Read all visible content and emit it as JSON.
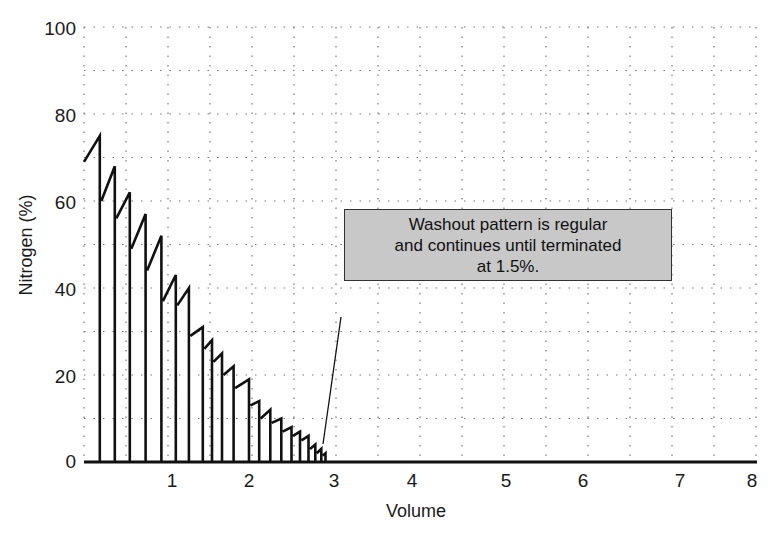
{
  "chart_data": {
    "type": "line",
    "title": "",
    "xlabel": "Volume",
    "ylabel": "Nitrogen (%)",
    "xlim": [
      0,
      8
    ],
    "ylim": [
      0,
      100
    ],
    "x_ticks": [
      "1",
      "2",
      "3",
      "4",
      "5",
      "6",
      "7",
      "8"
    ],
    "y_ticks": [
      "0",
      "20",
      "40",
      "60",
      "80",
      "100"
    ],
    "grid": true,
    "grid_style": "dotted",
    "legend": null,
    "series": [
      {
        "name": "Nitrogen washout (breath peaks)",
        "x": [
          0.18,
          0.35,
          0.52,
          0.7,
          0.88,
          1.05,
          1.22,
          1.4,
          1.52,
          1.65,
          1.8,
          2.0,
          2.12,
          2.25,
          2.38,
          2.5,
          2.6,
          2.7,
          2.78,
          2.85,
          2.9
        ],
        "start_values": [
          69,
          60,
          56,
          49,
          44,
          37,
          36,
          29,
          26,
          23,
          20,
          17,
          13,
          10,
          9,
          7,
          6,
          5,
          3,
          2,
          1.5
        ],
        "peak_values": [
          75,
          68,
          62,
          57,
          52,
          43,
          40,
          31,
          28,
          25,
          22,
          19,
          14,
          12,
          10,
          8,
          7,
          6,
          4,
          3,
          2
        ]
      }
    ],
    "annotations": [
      {
        "text": "Washout pattern is regular and continues until terminated at 1.5%.",
        "lines": [
          "Washout pattern is regular",
          "and continues until terminated",
          "at 1.5%."
        ],
        "pointer_to": {
          "x": 2.85,
          "y": 1.5
        }
      }
    ]
  },
  "annotation": {
    "line1": "Washout pattern is regular",
    "line2": "and continues until terminated",
    "line3": "at 1.5%."
  },
  "axes": {
    "xlabel": "Volume",
    "ylabel": "Nitrogen (%)",
    "x_ticks": [
      "1",
      "2",
      "3",
      "4",
      "5",
      "6",
      "7",
      "8"
    ],
    "y_ticks": [
      "0",
      "20",
      "40",
      "60",
      "80",
      "100"
    ]
  }
}
